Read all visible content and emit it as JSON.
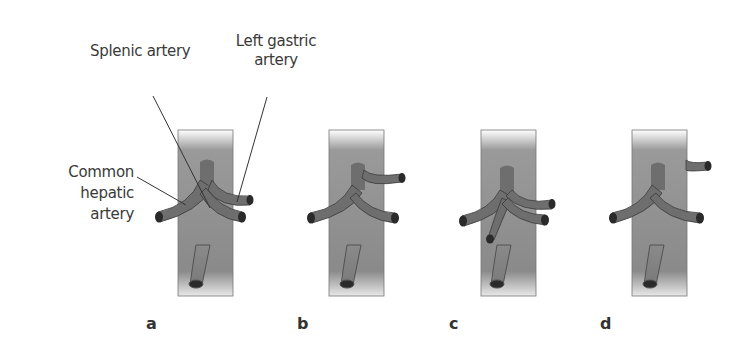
{
  "figure": {
    "labels": {
      "splenic": "Splenic artery",
      "left_gastric_line1": "Left gastric",
      "left_gastric_line2": "artery",
      "common_hepatic_line1": "Common",
      "common_hepatic_line2": "hepatic",
      "common_hepatic_line3": "artery"
    },
    "panels": [
      {
        "letter": "a",
        "variant": "normal trifurcation (celiac trunk)"
      },
      {
        "letter": "b",
        "variant": "left gastric arising from celiac trunk stem"
      },
      {
        "letter": "c",
        "variant": "additional branch from celiac trunk"
      },
      {
        "letter": "d",
        "variant": "left gastric arising directly from aorta"
      }
    ],
    "colors": {
      "aorta": "#8a8a8a",
      "vessel": "#6e6e6e",
      "vessel_outline": "#3a3a3a",
      "text": "#3a3a3a"
    }
  }
}
